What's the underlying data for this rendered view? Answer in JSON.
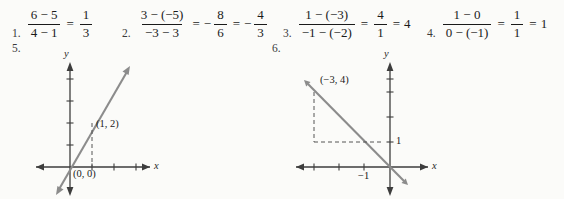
{
  "page": {
    "background": "#fbfbf9",
    "ink": "#1a1a1a",
    "graph_line_color": "#8c8c8c",
    "axis_color": "#3d3d3d"
  },
  "answers": [
    {
      "number": "1.",
      "fraction": {
        "numerator": "6 − 5",
        "denominator": "4 − 1"
      },
      "equals": "=",
      "result": {
        "numerator": "1",
        "denominator": "3"
      },
      "result_sign": "",
      "tail": ""
    },
    {
      "number": "2.",
      "fraction": {
        "numerator": "3 − (−5)",
        "denominator": "−3 − 3"
      },
      "equals": "=",
      "result": {
        "numerator": "8",
        "denominator": "6"
      },
      "result_sign": "−",
      "equals2": "=",
      "result2": {
        "numerator": "4",
        "denominator": "3"
      },
      "result2_sign": "−"
    },
    {
      "number": "3.",
      "fraction": {
        "numerator": "1 − (−3)",
        "denominator": "−1 − (−2)"
      },
      "equals": "=",
      "result": {
        "numerator": "4",
        "denominator": "1"
      },
      "result_sign": "",
      "equals2": "=",
      "tail": "4"
    },
    {
      "number": "4.",
      "fraction": {
        "numerator": "1 − 0",
        "denominator": "0 − (−1)"
      },
      "equals": "=",
      "result": {
        "numerator": "1",
        "denominator": "1"
      },
      "result_sign": "",
      "equals2": "=",
      "tail": "1"
    }
  ],
  "graphs": [
    {
      "number": "5.",
      "x_axis_label": "x",
      "y_axis_label": "y",
      "point_labels": [
        {
          "text": "(1, 2)"
        },
        {
          "text": "(0, 0)"
        }
      ],
      "tick_labels": [],
      "line": {
        "slope": 2,
        "intercept": 0,
        "direction": "rising"
      },
      "marked_points": [
        {
          "x": 1,
          "y": 2,
          "label": "(1, 2)"
        },
        {
          "x": 0,
          "y": 0,
          "label": "(0, 0)"
        }
      ],
      "dashed_guides": [
        "vertical drop from (1,2) to x-axis"
      ]
    },
    {
      "number": "6.",
      "x_axis_label": "x",
      "y_axis_label": "y",
      "point_labels": [
        {
          "text": "(−3, 4)"
        }
      ],
      "tick_labels": [
        {
          "text": "1",
          "axis": "y"
        },
        {
          "text": "−1",
          "axis": "x"
        }
      ],
      "line": {
        "slope": -1,
        "intercept": 1,
        "direction": "falling"
      },
      "marked_points": [
        {
          "x": -3,
          "y": 4,
          "label": "(−3, 4)"
        }
      ],
      "dashed_guides": [
        "vertical from (−3,4) down to y=1",
        "horizontal from (−3,1) right to the line at y=1"
      ]
    }
  ]
}
